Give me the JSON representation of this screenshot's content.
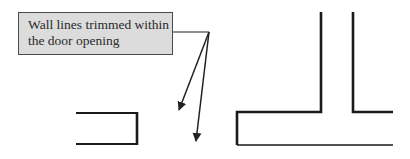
{
  "callout": {
    "lines": [
      "Wall lines trimmed within",
      "the door opening"
    ]
  },
  "colors": {
    "wall": "#1a1a1a",
    "callout_fill": "#dcdcdc",
    "callout_border": "#4a4a4a",
    "leader": "#222222"
  },
  "walls": {
    "left_fragment": "open rectangle with trimmed end at door opening",
    "right_fragment": "T-junction wall with trimmed bottom at door opening"
  }
}
